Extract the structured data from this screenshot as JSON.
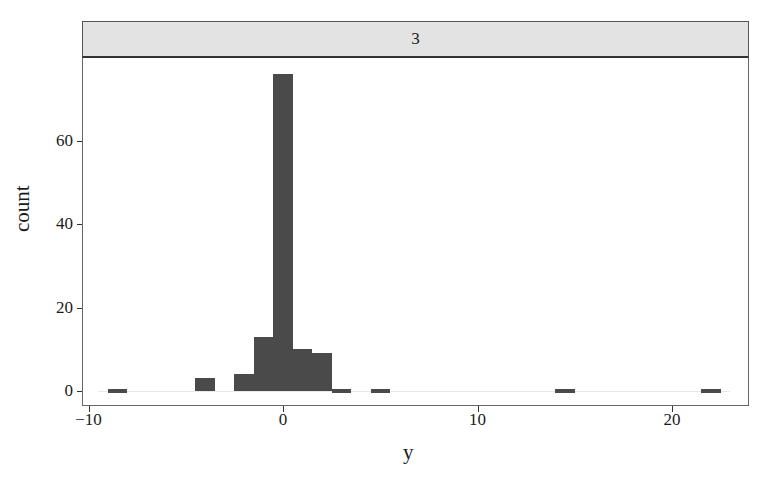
{
  "chart_data": {
    "type": "bar",
    "subtype": "histogram",
    "facet_label": "3",
    "title": "",
    "xlabel": "y",
    "ylabel": "count",
    "x_ticks": [
      -10,
      0,
      10,
      20
    ],
    "x_tick_labels": [
      "−10",
      "0",
      "10",
      "20"
    ],
    "y_ticks": [
      0,
      20,
      40,
      60
    ],
    "y_tick_labels": [
      "0",
      "20",
      "40",
      "60"
    ],
    "xlim": [
      -10.5,
      24
    ],
    "ylim": [
      -4,
      79
    ],
    "bin_width": 1,
    "bins": [
      {
        "center": -8.5,
        "count": 1
      },
      {
        "center": -4,
        "count": 3
      },
      {
        "center": -2,
        "count": 4
      },
      {
        "center": -1,
        "count": 13
      },
      {
        "center": 0,
        "count": 76
      },
      {
        "center": 1,
        "count": 10
      },
      {
        "center": 2,
        "count": 9
      },
      {
        "center": 3,
        "count": 1
      },
      {
        "center": 5,
        "count": 1
      },
      {
        "center": 14.5,
        "count": 1
      },
      {
        "center": 22,
        "count": 1
      }
    ],
    "grid": false,
    "legend": null,
    "bar_color": "#4a4a4a",
    "strip_color": "#e3e3e3"
  }
}
